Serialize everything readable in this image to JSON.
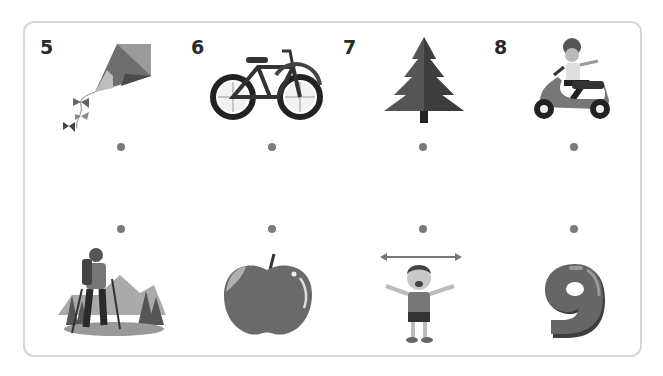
{
  "worksheet": {
    "title": "Match the pictures",
    "top_row": [
      {
        "number": "5",
        "picture": "kite"
      },
      {
        "number": "6",
        "picture": "bicycle"
      },
      {
        "number": "7",
        "picture": "pine tree"
      },
      {
        "number": "8",
        "picture": "girl riding scooter"
      }
    ],
    "bottom_row": [
      {
        "picture": "hiker with trekking poles"
      },
      {
        "picture": "apple"
      },
      {
        "picture": "boy with arms wide (width arrow)"
      },
      {
        "picture": "number nine"
      }
    ],
    "colors": {
      "ink": "#2b2b2b",
      "dot": "#7a7a7a",
      "frame": "#d6d6d6"
    }
  }
}
